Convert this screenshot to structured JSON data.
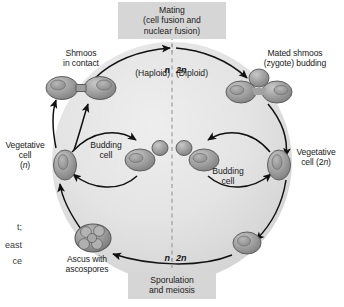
{
  "figure": {
    "background_color": "#ffffff",
    "circle_fill": "#e2e2e2",
    "box_fill": "#d6d6d6",
    "cell_fill": "#9a9a9a",
    "line_color": "#1a1a1a"
  },
  "process_boxes": {
    "top": "Mating\n(cell fusion and\nnuclear fusion)",
    "bottom": "Sporulation\nand meiosis"
  },
  "ploidy": {
    "top_left_symbol": "n",
    "top_right_symbol": "2n",
    "top_left_name": "(Haploid)",
    "top_right_name": "(Diploid)",
    "bottom_left_symbol": "n",
    "bottom_right_symbol": "2n"
  },
  "labels": {
    "shmoos_in_contact": "Shmoos\nin contact",
    "mated_shmoos": "Mated shmoos\n(zygote) budding",
    "vegetative_haploid": "Vegetative\ncell\n(n)",
    "vegetative_diploid": "Vegetative\ncell (2n)",
    "budding_cell_left": "Budding\ncell",
    "budding_cell_right": "Budding\ncell",
    "ascus": "Ascus with\nascospores"
  },
  "margin_text_fragments": [
    "t;",
    "east",
    "ce"
  ],
  "cells": {
    "shmoo_pair_lobes": 2,
    "mated_shmoo_lobes": 3,
    "ascospore_count": 5
  }
}
